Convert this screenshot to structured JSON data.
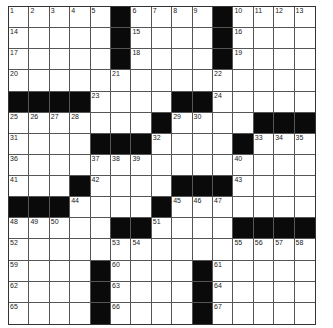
{
  "puzzle": {
    "rows": 15,
    "cols": 15,
    "colors": {
      "block": "#0a0a0a",
      "cell": "#ffffff",
      "line": "#555555"
    },
    "grid": [
      "1 2 3 4 5 # 6 7 8 9 # 10 11 12 13",
      "14 . . . . # 15 . . . # 16 . . .",
      "17 . . . . # 18 . . . # 19 . . .",
      "20 . . . . 21 . . . . 22 . . . .",
      "# # # # 23 . . . # # 24 . . . .",
      "25 26 27 28 . . . # 29 30 . . # # #",
      "31 . . . # # # 32 . . . # 33 34 35",
      "36 . . . 37 38 39 . . . . 40 . . .",
      "41 . . # 42 . . . # # # 43 . . .",
      "# # # 44 . . . # 45 46 47 . . . .",
      "48 49 50 . . # # 51 . . . # # # #",
      "52 . . . . 53 54 . . . . 55 56 57 58",
      "59 . . . # 60 . . . # 61 . . . .",
      "62 . . . # 63 . . . # 64 . . . .",
      "65 . . . # 66 . . . # 67 . . . ."
    ]
  }
}
